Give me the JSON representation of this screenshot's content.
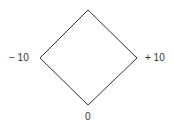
{
  "diagram": {
    "shape": "diamond",
    "stroke_color": "#333333",
    "vertices": {
      "top": [
        88,
        10
      ],
      "right": [
        137,
        58
      ],
      "bottom": [
        88,
        105
      ],
      "left": [
        40,
        58
      ]
    },
    "labels": {
      "left": "− 10",
      "right": "+ 10",
      "bottom": "0"
    }
  }
}
